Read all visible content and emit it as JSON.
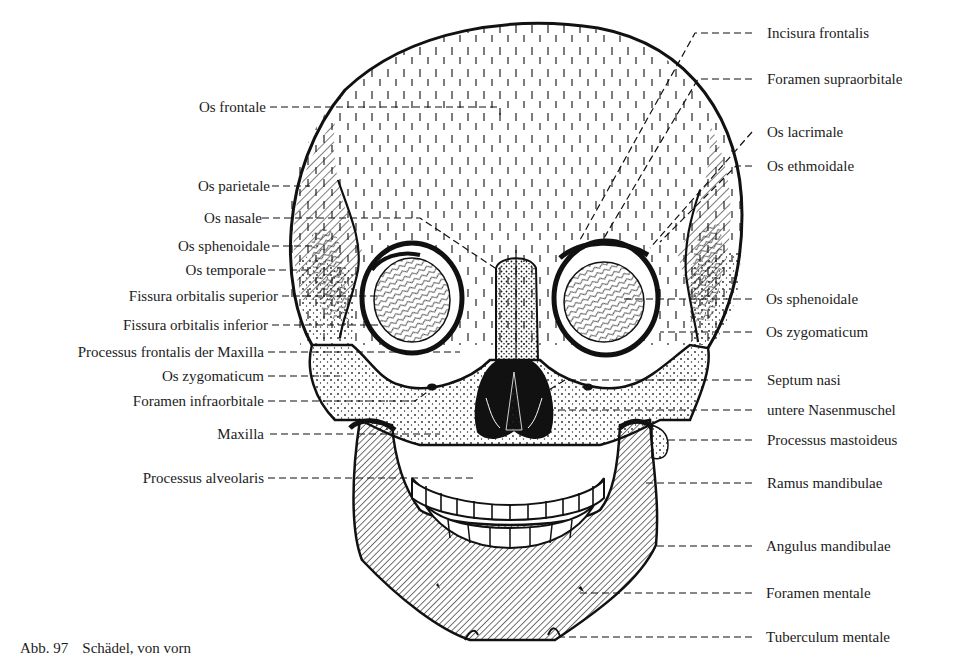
{
  "figure": {
    "caption_number": "Abb. 97",
    "caption_text": "Schädel, von vorn"
  },
  "labels_left": [
    {
      "text": "Os frontale",
      "y": 107
    },
    {
      "text": "Os parietale",
      "y": 186
    },
    {
      "text": "Os nasale",
      "y": 218
    },
    {
      "text": "Os sphenoidale",
      "y": 246
    },
    {
      "text": "Os temporale",
      "y": 270
    },
    {
      "text": "Fissura orbitalis superior",
      "y": 296
    },
    {
      "text": "Fissura orbitalis inferior",
      "y": 325
    },
    {
      "text": "Processus frontalis der Maxilla",
      "y": 352
    },
    {
      "text": "Os zygomaticum",
      "y": 376
    },
    {
      "text": "Foramen infraorbitale",
      "y": 401
    },
    {
      "text": "Maxilla",
      "y": 434
    },
    {
      "text": "Processus alveolaris",
      "y": 478
    }
  ],
  "labels_right": [
    {
      "text": "Incisura frontalis",
      "y": 33
    },
    {
      "text": "Foramen supraorbitale",
      "y": 79
    },
    {
      "text": "Os lacrimale",
      "y": 132
    },
    {
      "text": "Os ethmoidale",
      "y": 166
    },
    {
      "text": "Os sphenoidale",
      "y": 299
    },
    {
      "text": "Os zygomaticum",
      "y": 332
    },
    {
      "text": "Septum nasi",
      "y": 380
    },
    {
      "text": "untere Nasenmuschel",
      "y": 410
    },
    {
      "text": "Processus mastoideus",
      "y": 440
    },
    {
      "text": "Ramus mandibulae",
      "y": 483
    },
    {
      "text": "Angulus mandibulae",
      "y": 546
    },
    {
      "text": "Foramen mentale",
      "y": 593
    },
    {
      "text": "Tuberculum mentale",
      "y": 637
    }
  ],
  "colors": {
    "ink": "#111111",
    "paper": "#ffffff"
  }
}
